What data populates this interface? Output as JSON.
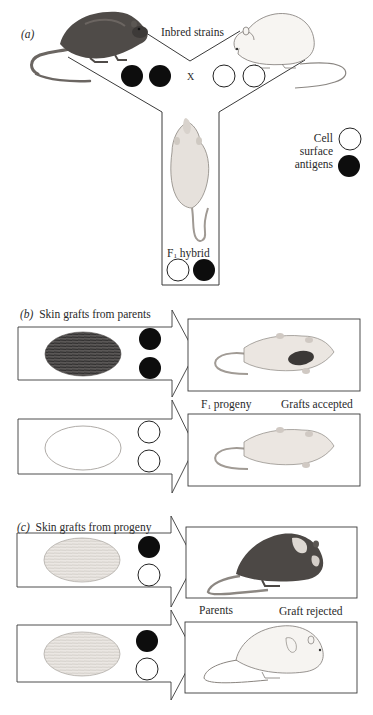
{
  "panel_a": {
    "label": "(a)",
    "title": "Inbred strains",
    "cross_symbol": "X",
    "hybrid_label_prefix": "F",
    "hybrid_label_sub": "1",
    "hybrid_label_suffix": " hybrid",
    "legend": {
      "line1": "Cell",
      "line2": "surface",
      "line3": "antigens"
    },
    "parent_left_antigens": [
      "black",
      "black"
    ],
    "parent_right_antigens": [
      "white",
      "white"
    ],
    "hybrid_antigens": [
      "white",
      "black"
    ]
  },
  "panel_b": {
    "label": "(b)",
    "title": "Skin grafts from parents",
    "recipient_label_prefix": "F",
    "recipient_label_sub": "1",
    "recipient_label_suffix": " progeny",
    "result": "Grafts accepted",
    "rows": [
      {
        "graft": "dark",
        "antigens": [
          "black",
          "black"
        ],
        "recipient": "white mouse with dark graft"
      },
      {
        "graft": "light",
        "antigens": [
          "white",
          "white"
        ],
        "recipient": "white mouse"
      }
    ]
  },
  "panel_c": {
    "label": "(c)",
    "title": "Skin grafts from progeny",
    "recipient_label": "Parents",
    "result": "Graft rejected",
    "rows": [
      {
        "graft": "hybrid",
        "antigens": [
          "black",
          "white"
        ],
        "recipient": "dark mouse with rejected graft"
      },
      {
        "graft": "hybrid",
        "antigens": [
          "black",
          "white"
        ],
        "recipient": "white mouse with rejected graft"
      }
    ]
  },
  "colors": {
    "line": "#3a3a3a",
    "black_antigen": "#0d0d0d",
    "white_antigen": "#ffffff",
    "dark_fur": "#4a4643",
    "light_fur": "#f2efea"
  }
}
